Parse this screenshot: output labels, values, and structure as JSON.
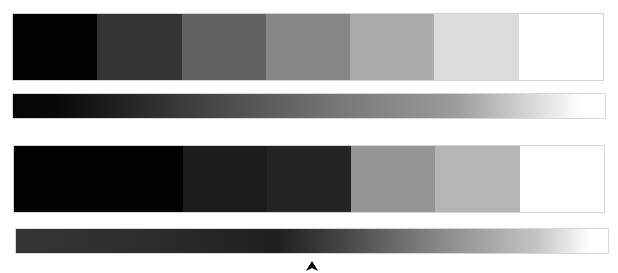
{
  "top_scale": {
    "swatches": [
      {
        "name": "step-1",
        "color": "#020202"
      },
      {
        "name": "step-2",
        "color": "#333333"
      },
      {
        "name": "step-3",
        "color": "#626262"
      },
      {
        "name": "step-4",
        "color": "#878787"
      },
      {
        "name": "step-5",
        "color": "#aaaaaa"
      },
      {
        "name": "step-6",
        "color": "#dcdcdc"
      },
      {
        "name": "step-7",
        "color": "#ffffff"
      }
    ],
    "gradient_stops": [
      {
        "offset": 0.0,
        "color": "#040404"
      },
      {
        "offset": 0.08,
        "color": "#0a0a0a"
      },
      {
        "offset": 0.3,
        "color": "#3e3e3e"
      },
      {
        "offset": 0.55,
        "color": "#777777"
      },
      {
        "offset": 0.75,
        "color": "#9c9c9c"
      },
      {
        "offset": 0.88,
        "color": "#dadada"
      },
      {
        "offset": 0.96,
        "color": "#ffffff"
      },
      {
        "offset": 1.0,
        "color": "#ffffff"
      }
    ]
  },
  "bottom_scale": {
    "swatches": [
      {
        "name": "step-1",
        "color": "#010101"
      },
      {
        "name": "step-2",
        "color": "#010101"
      },
      {
        "name": "step-3",
        "color": "#1c1c1c"
      },
      {
        "name": "step-4",
        "color": "#242424"
      },
      {
        "name": "step-5",
        "color": "#959595"
      },
      {
        "name": "step-6",
        "color": "#b5b5b5"
      },
      {
        "name": "step-7",
        "color": "#ffffff"
      }
    ],
    "gradient_stops": [
      {
        "offset": 0.0,
        "color": "#353535"
      },
      {
        "offset": 0.2,
        "color": "#2e2e2e"
      },
      {
        "offset": 0.44,
        "color": "#1f1f1f"
      },
      {
        "offset": 0.55,
        "color": "#454545"
      },
      {
        "offset": 0.72,
        "color": "#8a8a8a"
      },
      {
        "offset": 0.88,
        "color": "#c4c4c4"
      },
      {
        "offset": 0.97,
        "color": "#ffffff"
      },
      {
        "offset": 1.0,
        "color": "#ffffff"
      }
    ],
    "marker": {
      "icon": "arrowhead-up-icon",
      "color": "#000000",
      "position_fraction": 0.5
    }
  }
}
